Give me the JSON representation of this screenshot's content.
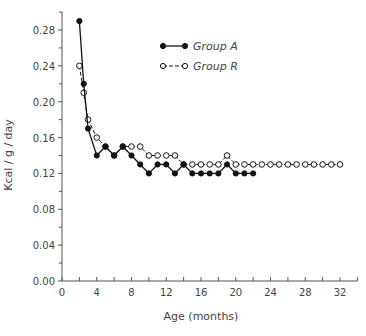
{
  "chart_data": {
    "type": "line",
    "title": "",
    "xlabel": "Age (months)",
    "ylabel": "Kcal / g / day",
    "xlim": [
      0,
      34
    ],
    "ylim": [
      0,
      0.3
    ],
    "x_ticks": [
      0,
      4,
      8,
      12,
      16,
      20,
      24,
      28,
      32
    ],
    "x_tick_labels": [
      "0",
      "4",
      "8",
      "12",
      "16",
      "20",
      "24",
      "28",
      "32"
    ],
    "y_ticks": [
      0.0,
      0.04,
      0.08,
      0.12,
      0.16,
      0.2,
      0.24,
      0.28
    ],
    "y_tick_labels": [
      "0.00",
      "0.04",
      "0.08",
      "0.12",
      "0.16",
      "0.20",
      "0.24",
      "0.28"
    ],
    "grid": false,
    "legend_position": "upper center",
    "series": [
      {
        "name": "Group A",
        "marker": "filled-circle",
        "line": "solid",
        "x": [
          2,
          2.5,
          3,
          4,
          5,
          6,
          7,
          8,
          9,
          10,
          11,
          12,
          13,
          14,
          15,
          16,
          17,
          18,
          19,
          20,
          21,
          22
        ],
        "values": [
          0.29,
          0.22,
          0.17,
          0.14,
          0.15,
          0.14,
          0.15,
          0.14,
          0.13,
          0.12,
          0.13,
          0.13,
          0.12,
          0.13,
          0.12,
          0.12,
          0.12,
          0.12,
          0.13,
          0.12,
          0.12,
          0.12
        ]
      },
      {
        "name": "Group R",
        "marker": "open-circle",
        "line": "dashed",
        "x": [
          2,
          2.5,
          3,
          4,
          5,
          6,
          7,
          8,
          9,
          10,
          11,
          12,
          13,
          14,
          15,
          16,
          17,
          18,
          19,
          20,
          21,
          22,
          23,
          24,
          25,
          26,
          27,
          28,
          29,
          30,
          31,
          32
        ],
        "values": [
          0.24,
          0.21,
          0.18,
          0.16,
          0.15,
          0.14,
          0.15,
          0.15,
          0.15,
          0.14,
          0.14,
          0.14,
          0.14,
          0.13,
          0.13,
          0.13,
          0.13,
          0.13,
          0.14,
          0.13,
          0.13,
          0.13,
          0.13,
          0.13,
          0.13,
          0.13,
          0.13,
          0.13,
          0.13,
          0.13,
          0.13,
          0.13
        ]
      }
    ]
  },
  "legend": {
    "items": [
      {
        "label": "Group A"
      },
      {
        "label": "Group R"
      }
    ]
  },
  "axes": {
    "xlabel": "Age (months)",
    "ylabel": "Kcal / g / day"
  }
}
